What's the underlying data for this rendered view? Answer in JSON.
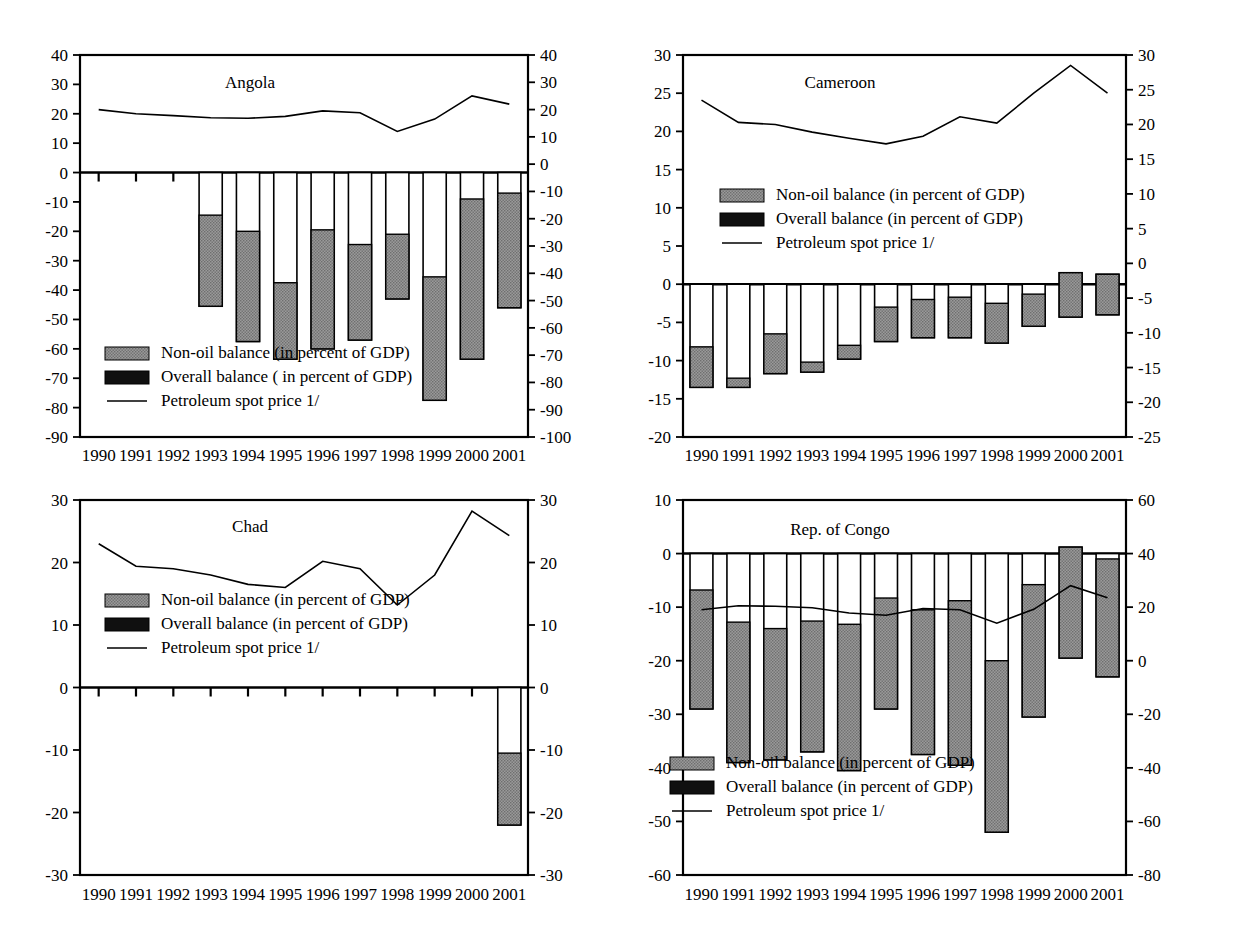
{
  "figure": {
    "background": "#ffffff",
    "series_colors": {
      "non_oil_balance": "#878787",
      "overall_balance": "#101010",
      "petroleum_spot_price": "#000000",
      "bar_outline": "#000000"
    },
    "legend_labels": {
      "non_oil": "Non-oil balance (in percent of GDP)",
      "non_oil_angola": "Non-oil balance (in percent of GDP)",
      "overall": "Overall balance (in percent of GDP)",
      "overall_angola": "Overall balance ( in percent of GDP)",
      "price": "Petroleum spot price 1/"
    },
    "years": [
      "1990",
      "1991",
      "1992",
      "1993",
      "1994",
      "1995",
      "1996",
      "1997",
      "1998",
      "1999",
      "2000",
      "2001"
    ]
  },
  "chart_data": [
    {
      "id": "angola",
      "type": "bar",
      "title": "Angola",
      "xlabel": "",
      "ylabel": "",
      "grid": false,
      "legend_position": "lower-left",
      "categories": [
        "1990",
        "1991",
        "1992",
        "1993",
        "1994",
        "1995",
        "1996",
        "1997",
        "1998",
        "1999",
        "2000",
        "2001"
      ],
      "left_axis": {
        "label": "",
        "ylim": [
          -90,
          40
        ],
        "ticks": [
          40,
          30,
          20,
          10,
          0,
          -10,
          -20,
          -30,
          -40,
          -50,
          -60,
          -70,
          -80,
          -90
        ]
      },
      "right_axis": {
        "label": "",
        "ylim": [
          -100,
          40
        ],
        "ticks": [
          40,
          30,
          20,
          10,
          0,
          -10,
          -20,
          -30,
          -40,
          -50,
          -60,
          -70,
          -80,
          -90,
          -100
        ]
      },
      "series": [
        {
          "name": "Non-oil balance (in percent of GDP)",
          "axis": "left",
          "kind": "bar-segment",
          "values": [
            null,
            null,
            null,
            -45.5,
            -57.5,
            -63.5,
            -60.0,
            -57.0,
            -43.0,
            -77.5,
            -63.5,
            -46.0
          ]
        },
        {
          "name": "Overall balance ( in percent of GDP)",
          "axis": "left",
          "kind": "bar-top",
          "values": [
            null,
            null,
            null,
            -14.5,
            -20.0,
            -37.5,
            -19.5,
            -24.5,
            -21.0,
            -35.5,
            -9.0,
            -7.0
          ]
        },
        {
          "name": "Petroleum spot price 1/",
          "axis": "right",
          "kind": "line",
          "values": [
            20.0,
            18.5,
            17.8,
            17.0,
            16.8,
            17.5,
            19.5,
            18.8,
            12.0,
            16.5,
            25.0,
            22.0
          ]
        }
      ]
    },
    {
      "id": "cameroon",
      "type": "bar",
      "title": "Cameroon",
      "xlabel": "",
      "ylabel": "",
      "grid": false,
      "legend_position": "middle-center",
      "categories": [
        "1990",
        "1991",
        "1992",
        "1993",
        "1994",
        "1995",
        "1996",
        "1997",
        "1998",
        "1999",
        "2000",
        "2001"
      ],
      "left_axis": {
        "label": "",
        "ylim": [
          -20,
          30
        ],
        "ticks": [
          30,
          25,
          20,
          15,
          10,
          5,
          0,
          -5,
          -10,
          -15,
          -20
        ]
      },
      "right_axis": {
        "label": "",
        "ylim": [
          -25,
          30
        ],
        "ticks": [
          30,
          25,
          20,
          15,
          10,
          5,
          0,
          -5,
          -10,
          -15,
          -20,
          -25
        ]
      },
      "series": [
        {
          "name": "Non-oil balance (in percent of GDP)",
          "axis": "left",
          "kind": "bar-segment",
          "values": [
            -13.5,
            -13.5,
            -11.7,
            -11.5,
            -9.8,
            -7.5,
            -7.0,
            -7.0,
            -7.7,
            -5.5,
            -4.3,
            -4.0
          ]
        },
        {
          "name": "Overall balance (in percent of GDP)",
          "axis": "left",
          "kind": "bar-top",
          "values": [
            -8.2,
            -12.3,
            -6.5,
            -10.2,
            -8.0,
            -3.0,
            -2.0,
            -1.7,
            -2.5,
            -1.3,
            1.5,
            1.3
          ]
        },
        {
          "name": "Petroleum spot price 1/",
          "axis": "right",
          "kind": "line",
          "values": [
            23.5,
            20.3,
            20.0,
            18.9,
            18.0,
            17.2,
            18.3,
            21.1,
            20.2,
            24.5,
            28.5,
            24.5
          ]
        }
      ]
    },
    {
      "id": "chad",
      "type": "bar",
      "title": "Chad",
      "xlabel": "",
      "ylabel": "",
      "grid": false,
      "legend_position": "middle-center",
      "categories": [
        "1990",
        "1991",
        "1992",
        "1993",
        "1994",
        "1995",
        "1996",
        "1997",
        "1998",
        "1999",
        "2000",
        "2001"
      ],
      "left_axis": {
        "label": "",
        "ylim": [
          -30,
          30
        ],
        "ticks": [
          30,
          20,
          10,
          0,
          -10,
          -20,
          -30
        ]
      },
      "right_axis": {
        "label": "",
        "ylim": [
          -30,
          30
        ],
        "ticks": [
          30,
          20,
          10,
          0,
          -10,
          -20,
          -30
        ]
      },
      "series": [
        {
          "name": "Non-oil balance (in percent of GDP)",
          "axis": "left",
          "kind": "bar-segment",
          "values": [
            null,
            null,
            null,
            null,
            null,
            null,
            null,
            null,
            null,
            null,
            null,
            -22.0
          ]
        },
        {
          "name": "Overall balance (in percent of GDP)",
          "axis": "left",
          "kind": "bar-top",
          "values": [
            null,
            null,
            null,
            null,
            null,
            null,
            null,
            null,
            null,
            null,
            null,
            -10.5
          ]
        },
        {
          "name": "Petroleum spot price 1/",
          "axis": "right",
          "kind": "line",
          "values": [
            23.0,
            19.4,
            19.0,
            18.0,
            16.5,
            16.0,
            20.2,
            19.0,
            13.2,
            18.0,
            28.2,
            24.3
          ]
        }
      ]
    },
    {
      "id": "congo",
      "type": "bar",
      "title": "Rep. of Congo",
      "xlabel": "",
      "ylabel": "",
      "grid": false,
      "legend_position": "lower-left",
      "categories": [
        "1990",
        "1991",
        "1992",
        "1993",
        "1994",
        "1995",
        "1996",
        "1997",
        "1998",
        "1999",
        "2000",
        "2001"
      ],
      "left_axis": {
        "label": "",
        "ylim": [
          -60,
          10
        ],
        "ticks": [
          10,
          0,
          -10,
          -20,
          -30,
          -40,
          -50,
          -60
        ]
      },
      "right_axis": {
        "label": "",
        "ylim": [
          -80,
          60
        ],
        "ticks": [
          60,
          40,
          20,
          0,
          -20,
          -40,
          -60,
          -80
        ]
      },
      "series": [
        {
          "name": "Non-oil balance (in percent of GDP)",
          "axis": "left",
          "kind": "bar-segment",
          "values": [
            -29.0,
            -39.0,
            -38.5,
            -37.0,
            -40.5,
            -29.0,
            -37.5,
            -39.5,
            -52.0,
            -30.5,
            -19.5,
            -23.0
          ]
        },
        {
          "name": "Overall balance (in percent of GDP)",
          "axis": "left",
          "kind": "bar-top",
          "values": [
            -6.8,
            -12.8,
            -14.0,
            -12.6,
            -13.2,
            -8.3,
            -10.5,
            -8.8,
            -20.0,
            -5.8,
            1.2,
            -1.0
          ]
        },
        {
          "name": "Petroleum spot price 1/",
          "axis": "right",
          "kind": "line",
          "values": [
            19.0,
            20.5,
            20.3,
            19.8,
            17.8,
            17.0,
            19.5,
            19.0,
            14.0,
            19.2,
            28.0,
            23.5
          ]
        }
      ]
    }
  ]
}
